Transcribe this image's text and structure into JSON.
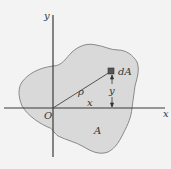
{
  "figure": {
    "axes": {
      "x_label": "x",
      "y_label": "y",
      "origin_label": "O"
    },
    "region_label": "A",
    "element_label": "dA",
    "radius_label": "ρ",
    "x_distance_label": "x",
    "y_distance_label": "y"
  },
  "colors": {
    "background": "#f3f3f3",
    "region_fill": "#d9d9d9",
    "region_stroke": "#8a8a8a",
    "axis": "#3a3a3a",
    "element": "#555555"
  }
}
